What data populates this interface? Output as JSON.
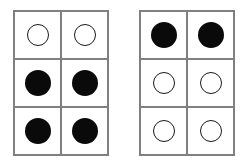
{
  "figure": {
    "background_color": "#ffffff",
    "grid_line_color": "#808080",
    "filled_circle_color": "#0a0a0a",
    "hollow_circle_fill": "#ffffff",
    "hollow_circle_stroke": "#1a1a1a",
    "panel_count": 2,
    "rows": 3,
    "columns": 2
  },
  "panels": [
    {
      "name": "left-grid",
      "label": "Left grid",
      "rows": [
        {
          "row_index": 1,
          "cells": [
            {
              "state": "hollow",
              "label": "open circle"
            },
            {
              "state": "hollow",
              "label": "open circle"
            }
          ]
        },
        {
          "row_index": 2,
          "cells": [
            {
              "state": "filled",
              "label": "filled circle"
            },
            {
              "state": "filled",
              "label": "filled circle"
            }
          ]
        },
        {
          "row_index": 3,
          "cells": [
            {
              "state": "filled",
              "label": "filled circle"
            },
            {
              "state": "filled",
              "label": "filled circle"
            }
          ]
        }
      ]
    },
    {
      "name": "right-grid",
      "label": "Right grid",
      "rows": [
        {
          "row_index": 1,
          "cells": [
            {
              "state": "filled",
              "label": "filled circle"
            },
            {
              "state": "filled",
              "label": "filled circle"
            }
          ]
        },
        {
          "row_index": 2,
          "cells": [
            {
              "state": "hollow",
              "label": "open circle"
            },
            {
              "state": "hollow",
              "label": "open circle"
            }
          ]
        },
        {
          "row_index": 3,
          "cells": [
            {
              "state": "hollow",
              "label": "open circle"
            },
            {
              "state": "hollow",
              "label": "open circle"
            }
          ]
        }
      ]
    }
  ]
}
